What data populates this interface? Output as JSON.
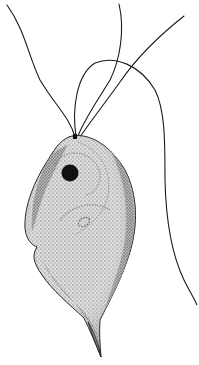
{
  "figure": {
    "background_color": "#ffffff",
    "ink_color": "#1a1a1a",
    "body_fill": "#d6d6d6",
    "body_shade": "#9a9a9a",
    "nucleus_color": "#111111",
    "parts": {
      "anterior_flagella_count": 3,
      "trailing_flagellum": "undulating flagellum extending to lower right",
      "nucleus": "dark round nucleus near anterior",
      "axostyle_tail": "pointed posterior tip"
    }
  }
}
